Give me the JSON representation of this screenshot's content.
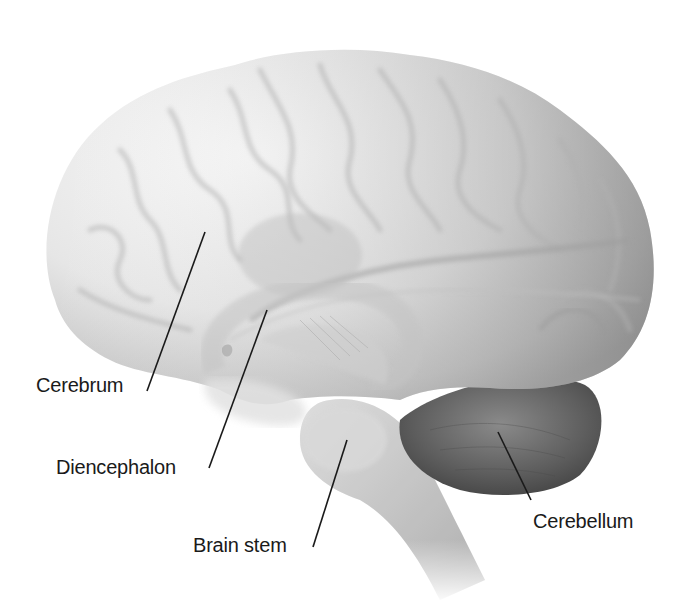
{
  "figure": {
    "labels": [
      {
        "id": "cerebrum",
        "text": "Cerebrum",
        "x": 36,
        "y": 373,
        "line": [
          147,
          391,
          205,
          232
        ]
      },
      {
        "id": "diencephalon",
        "text": "Diencephalon",
        "x": 56,
        "y": 455,
        "line": [
          209,
          468,
          267,
          310
        ]
      },
      {
        "id": "brain-stem",
        "text": "Brain stem",
        "x": 193,
        "y": 533,
        "line": [
          313,
          547,
          347,
          440
        ]
      },
      {
        "id": "cerebellum",
        "text": "Cerebellum",
        "x": 533,
        "y": 509,
        "line": [
          531,
          500,
          498,
          432
        ]
      }
    ]
  },
  "colors": {
    "background": "#ffffff",
    "cerebrum_light": "#f2f2f2",
    "cerebrum_mid": "#d4d4d4",
    "cerebrum_dark": "#9a9a9a",
    "diencephalon": "#c8c8c8",
    "brainstem": "#c9c9c9",
    "cerebellum": "#5c5c5c",
    "label_text": "#1a1a1a",
    "leader_line": "#1a1a1a"
  }
}
